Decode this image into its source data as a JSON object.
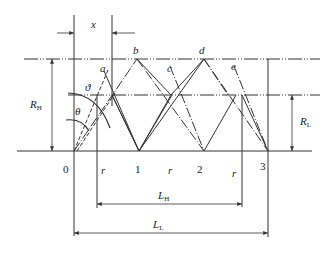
{
  "diagram": {
    "labels": {
      "x": "x",
      "a": "a",
      "b": "b",
      "c": "c",
      "d": "d",
      "e": "e",
      "theta_small": "ϑ",
      "theta": "θ",
      "RH_main": "R",
      "RH_sub": "H",
      "RL_main": "R",
      "RL_sub": "L",
      "LH_main": "L",
      "LH_sub": "H",
      "LL_main": "L",
      "LL_sub": "L",
      "r1": "r",
      "r2": "r",
      "r3": "r"
    },
    "points": [
      "0",
      "1",
      "2",
      "3"
    ],
    "colors": {
      "line": "#333333",
      "background": "#ffffff"
    }
  }
}
